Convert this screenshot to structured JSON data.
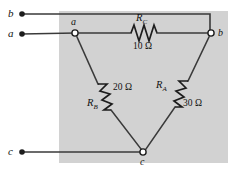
{
  "figure": {
    "name": "delta-network-resistor-diagram",
    "background_color": "#ffffff",
    "shaded_region_color": "#d2d2d2",
    "wire_color": "#3a3a3a"
  },
  "terminals": [
    {
      "id": "terminal-b",
      "label": "b",
      "x": 22,
      "y": 14
    },
    {
      "id": "terminal-a",
      "label": "a",
      "x": 22,
      "y": 34
    },
    {
      "id": "terminal-c",
      "label": "c",
      "x": 22,
      "y": 152
    }
  ],
  "nodes": [
    {
      "id": "node-a",
      "label": "a",
      "x": 75,
      "y": 33
    },
    {
      "id": "node-b",
      "label": "b",
      "x": 211,
      "y": 33
    },
    {
      "id": "node-c",
      "label": "c",
      "x": 143,
      "y": 152
    }
  ],
  "resistors": [
    {
      "id": "resistor-rc",
      "name": "R",
      "subscript": "C",
      "value": "10 Ω",
      "between": "a-b",
      "name_x": 136,
      "name_y": 13,
      "value_x": 133,
      "value_y": 42
    },
    {
      "id": "resistor-rb",
      "name": "R",
      "subscript": "B",
      "value": "20 Ω",
      "between": "a-c",
      "name_x": 87,
      "name_y": 98,
      "value_x": 113,
      "value_y": 83
    },
    {
      "id": "resistor-ra",
      "name": "R",
      "subscript": "A",
      "value": "30 Ω",
      "between": "b-c",
      "name_x": 156,
      "name_y": 80,
      "value_x": 183,
      "value_y": 99
    }
  ],
  "axis_units": "Ω"
}
